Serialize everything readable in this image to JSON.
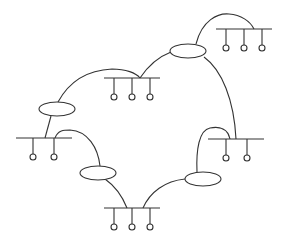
{
  "diagram": {
    "type": "network-topology",
    "colors": {
      "stroke": "#333333",
      "background": "#ffffff"
    },
    "lans": [
      {
        "id": "lan-top-right",
        "bus": [
          216,
          272,
          29
        ],
        "hosts_x": [
          226,
          244,
          262
        ],
        "host_y": 48
      },
      {
        "id": "lan-upper-middle",
        "bus": [
          104,
          160,
          78
        ],
        "hosts_x": [
          114,
          132,
          150
        ],
        "host_y": 97
      },
      {
        "id": "lan-left",
        "bus": [
          16,
          72,
          138
        ],
        "hosts_x": [
          33,
          54
        ],
        "host_y": 157
      },
      {
        "id": "lan-right",
        "bus": [
          208,
          264,
          139
        ],
        "hosts_x": [
          226,
          247
        ],
        "host_y": 158
      },
      {
        "id": "lan-bottom",
        "bus": [
          104,
          160,
          208
        ],
        "hosts_x": [
          114,
          132,
          150
        ],
        "host_y": 227
      }
    ],
    "routers": [
      {
        "id": "router-top",
        "cx": 188,
        "cy": 51
      },
      {
        "id": "router-left",
        "cx": 57,
        "cy": 109
      },
      {
        "id": "router-lower-left",
        "cx": 98,
        "cy": 173
      },
      {
        "id": "router-lower-right",
        "cx": 203,
        "cy": 179
      }
    ]
  }
}
